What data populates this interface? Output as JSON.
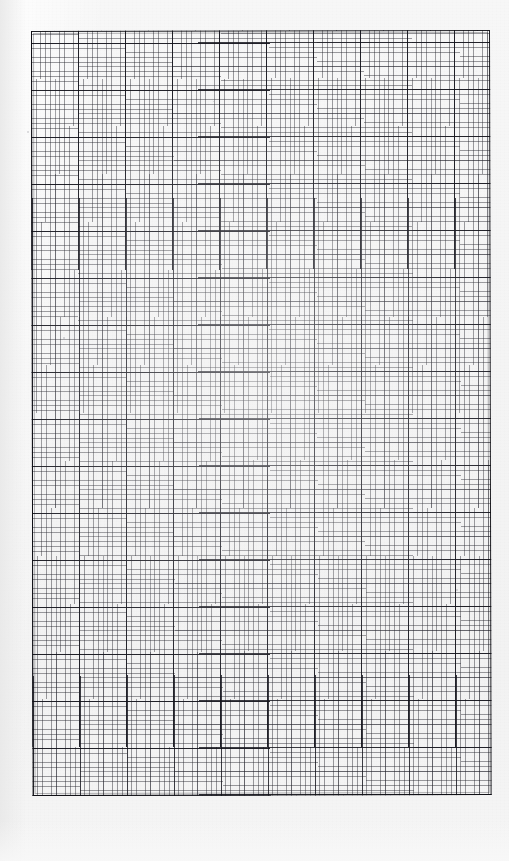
{
  "document": {
    "type": "graph-paper-scan",
    "title": "Blank graph paper sheet",
    "description": "Scanned sheet of blank millimetre / engineering graph paper with no handwriting, no text and no plotted data.",
    "alt_text": "A scanned page of blank graph paper: a rectangular ruled grid printed in dark grey on an off-white sheet.",
    "background_color": "#f4f4f4",
    "paper_color": "#f5f5f5",
    "ink_color": "#14141c"
  },
  "grid": {
    "label": "graph-paper-grid",
    "left_px": 31,
    "top_px": 31,
    "width_px": 459,
    "height_px": 765,
    "minor_cell_px": 4.7,
    "medium_every_minor_cells": 5,
    "major_every_minor_cells": 10,
    "major_cell_px": 47,
    "minor_columns": 98,
    "minor_rows": 163,
    "major_columns": 10,
    "major_rows": 16,
    "minor_line_color": "#282830",
    "medium_line_color": "#1e1e28",
    "major_line_color": "#12121a",
    "border_color": "#0e0e14",
    "border_width_px": 1.6,
    "rotation_deg": -0.12
  },
  "annotations": {
    "text_content": "",
    "plotted_series": [],
    "axis_labels": [],
    "tick_labels": [],
    "legend_entries": [],
    "note": "No text, numbers, axis labels or drawn marks are present anywhere on the sheet."
  },
  "artifacts": {
    "label": "scan-specks",
    "items": [
      {
        "x": 27,
        "y": 131,
        "size": 2.0
      },
      {
        "x": 63,
        "y": 337,
        "size": 1.6
      },
      {
        "x": 213,
        "y": 101,
        "size": 1.4
      },
      {
        "x": 456,
        "y": 589,
        "size": 1.8
      },
      {
        "x": 300,
        "y": 713,
        "size": 1.3
      }
    ]
  }
}
